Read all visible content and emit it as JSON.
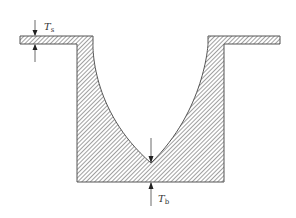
{
  "diagram": {
    "labels": {
      "top_thickness": {
        "main": "T",
        "sub": "s"
      },
      "bottom_thickness": {
        "main": "T",
        "sub": "b"
      }
    },
    "colors": {
      "outline": "#555555",
      "hatch": "#777777",
      "fill": "#ffffff",
      "arrow": "#444444"
    }
  }
}
